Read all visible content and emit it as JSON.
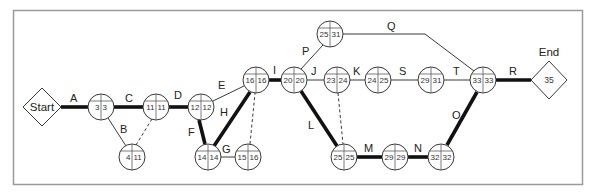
{
  "diagram": {
    "type": "activity-on-arrow network (critical path)",
    "start": {
      "label": "Start",
      "x": 42,
      "y": 107
    },
    "end": {
      "label": "End",
      "value": "35",
      "x": 549,
      "y": 80
    },
    "nodes": [
      {
        "id": "n1",
        "x": 101,
        "y": 107,
        "es": "3",
        "lf": "3"
      },
      {
        "id": "n2",
        "x": 156,
        "y": 107,
        "es": "11",
        "lf": "11"
      },
      {
        "id": "n3",
        "x": 132,
        "y": 157,
        "es": "4",
        "lf": "11"
      },
      {
        "id": "n4",
        "x": 201,
        "y": 107,
        "es": "12",
        "lf": "12"
      },
      {
        "id": "n5",
        "x": 208,
        "y": 157,
        "es": "14",
        "lf": "14"
      },
      {
        "id": "n6",
        "x": 248,
        "y": 157,
        "es": "15",
        "lf": "16"
      },
      {
        "id": "n7",
        "x": 256,
        "y": 80,
        "es": "16",
        "lf": "16"
      },
      {
        "id": "n8",
        "x": 294,
        "y": 80,
        "es": "20",
        "lf": "20"
      },
      {
        "id": "n9",
        "x": 330,
        "y": 34,
        "es": "25",
        "lf": "31"
      },
      {
        "id": "n10",
        "x": 337,
        "y": 80,
        "es": "23",
        "lf": "24"
      },
      {
        "id": "n11",
        "x": 378,
        "y": 80,
        "es": "24",
        "lf": "25"
      },
      {
        "id": "n12",
        "x": 431,
        "y": 80,
        "es": "29",
        "lf": "31"
      },
      {
        "id": "n13",
        "x": 483,
        "y": 80,
        "es": "33",
        "lf": "33"
      },
      {
        "id": "n14",
        "x": 344,
        "y": 157,
        "es": "25",
        "lf": "25"
      },
      {
        "id": "n15",
        "x": 395,
        "y": 157,
        "es": "29",
        "lf": "29"
      },
      {
        "id": "n16",
        "x": 441,
        "y": 157,
        "es": "32",
        "lf": "32"
      }
    ],
    "activities": [
      {
        "label": "A",
        "from": "start",
        "to": "n1",
        "critical": true
      },
      {
        "label": "B",
        "from": "n1",
        "to": "n3",
        "critical": false
      },
      {
        "label": "C",
        "from": "n1",
        "to": "n2",
        "critical": true
      },
      {
        "label": "D",
        "from": "n2",
        "to": "n4",
        "critical": true
      },
      {
        "label": "E",
        "from": "n4",
        "to": "n7",
        "critical": false
      },
      {
        "label": "F",
        "from": "n4",
        "to": "n5",
        "critical": true
      },
      {
        "label": "G",
        "from": "n5",
        "to": "n6",
        "critical": false
      },
      {
        "label": "H",
        "from": "n5",
        "to": "n7",
        "critical": true
      },
      {
        "label": "I",
        "from": "n7",
        "to": "n8",
        "critical": true
      },
      {
        "label": "J",
        "from": "n8",
        "to": "n10",
        "critical": false
      },
      {
        "label": "K",
        "from": "n10",
        "to": "n11",
        "critical": false
      },
      {
        "label": "L",
        "from": "n8",
        "to": "n14",
        "critical": true
      },
      {
        "label": "M",
        "from": "n14",
        "to": "n15",
        "critical": true
      },
      {
        "label": "N",
        "from": "n15",
        "to": "n16",
        "critical": true
      },
      {
        "label": "O",
        "from": "n16",
        "to": "n13",
        "critical": true
      },
      {
        "label": "P",
        "from": "n8",
        "to": "n9",
        "critical": false
      },
      {
        "label": "Q",
        "from": "n9",
        "to": "n13",
        "critical": false
      },
      {
        "label": "R",
        "from": "n13",
        "to": "end",
        "critical": true
      },
      {
        "label": "S",
        "from": "n11",
        "to": "n12",
        "critical": false
      },
      {
        "label": "T",
        "from": "n12",
        "to": "n13",
        "critical": false
      }
    ],
    "dummies": [
      {
        "from": "n3",
        "to": "n2"
      },
      {
        "from": "n6",
        "to": "n7"
      },
      {
        "from": "n10",
        "to": "n14"
      }
    ],
    "colors": {
      "critical": "#111111",
      "normal": "#3a3a3a",
      "frame": "#9a9a9a"
    }
  }
}
